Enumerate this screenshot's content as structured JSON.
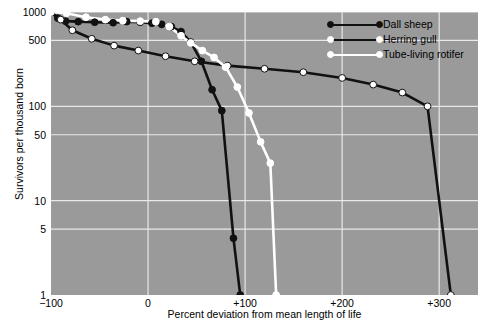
{
  "chart_data": {
    "type": "line",
    "title": "",
    "xlabel": "Percent deviation from mean length of life",
    "ylabel": "Survivors per thousand born",
    "xlim": [
      -100,
      340
    ],
    "ylim": [
      1,
      1000
    ],
    "yscale": "log",
    "grid": true,
    "legend_position": "top-right",
    "background_color": "#9a9a9a",
    "xticks": [
      {
        "value": -100,
        "label": "−100"
      },
      {
        "value": 0,
        "label": "0"
      },
      {
        "value": 100,
        "label": "+100"
      },
      {
        "value": 200,
        "label": "+200"
      },
      {
        "value": 300,
        "label": "+300"
      }
    ],
    "yticks": [
      {
        "value": 1000,
        "label": "1000"
      },
      {
        "value": 500,
        "label": "500"
      },
      {
        "value": 100,
        "label": "100"
      },
      {
        "value": 50,
        "label": "50"
      },
      {
        "value": 10,
        "label": "10"
      },
      {
        "value": 5,
        "label": "5"
      },
      {
        "value": 1,
        "label": "1"
      }
    ],
    "gridlines_x": [
      0,
      100,
      200,
      300
    ],
    "gridlines_y": [
      1000,
      500,
      100,
      50,
      10,
      5
    ],
    "series": [
      {
        "name": "Dall sheep",
        "line_color": "#111111",
        "marker_color": "#111111",
        "marker_edge": "#111111",
        "points": [
          {
            "x": -100,
            "y": 1000
          },
          {
            "x": -93,
            "y": 860
          },
          {
            "x": -85,
            "y": 800
          },
          {
            "x": -72,
            "y": 790
          },
          {
            "x": -55,
            "y": 780
          },
          {
            "x": -36,
            "y": 770
          },
          {
            "x": -22,
            "y": 790
          },
          {
            "x": -8,
            "y": 780
          },
          {
            "x": 4,
            "y": 760
          },
          {
            "x": 14,
            "y": 740
          },
          {
            "x": 24,
            "y": 700
          },
          {
            "x": 34,
            "y": 620
          },
          {
            "x": 44,
            "y": 480
          },
          {
            "x": 55,
            "y": 300
          },
          {
            "x": 66,
            "y": 150
          },
          {
            "x": 76,
            "y": 90
          },
          {
            "x": 88,
            "y": 4
          },
          {
            "x": 95,
            "y": 1
          }
        ]
      },
      {
        "name": "Herring gull",
        "line_color": "#111111",
        "marker_color": "#ffffff",
        "marker_edge": "#111111",
        "points": [
          {
            "x": -100,
            "y": 1000
          },
          {
            "x": -90,
            "y": 830
          },
          {
            "x": -78,
            "y": 640
          },
          {
            "x": -58,
            "y": 520
          },
          {
            "x": -35,
            "y": 440
          },
          {
            "x": -10,
            "y": 390
          },
          {
            "x": 18,
            "y": 340
          },
          {
            "x": 48,
            "y": 300
          },
          {
            "x": 82,
            "y": 270
          },
          {
            "x": 120,
            "y": 250
          },
          {
            "x": 160,
            "y": 230
          },
          {
            "x": 200,
            "y": 200
          },
          {
            "x": 232,
            "y": 170
          },
          {
            "x": 262,
            "y": 140
          },
          {
            "x": 288,
            "y": 100
          },
          {
            "x": 312,
            "y": 1
          }
        ]
      },
      {
        "name": "Tube-living rotifer",
        "line_color": "#ffffff",
        "marker_color": "#ffffff",
        "marker_edge": "#ffffff",
        "points": [
          {
            "x": -100,
            "y": 1000
          },
          {
            "x": -84,
            "y": 970
          },
          {
            "x": -64,
            "y": 880
          },
          {
            "x": -44,
            "y": 830
          },
          {
            "x": -26,
            "y": 810
          },
          {
            "x": -8,
            "y": 800
          },
          {
            "x": 8,
            "y": 790
          },
          {
            "x": 22,
            "y": 700
          },
          {
            "x": 34,
            "y": 560
          },
          {
            "x": 44,
            "y": 470
          },
          {
            "x": 56,
            "y": 390
          },
          {
            "x": 68,
            "y": 330
          },
          {
            "x": 80,
            "y": 260
          },
          {
            "x": 92,
            "y": 160
          },
          {
            "x": 104,
            "y": 85
          },
          {
            "x": 116,
            "y": 42
          },
          {
            "x": 126,
            "y": 25
          },
          {
            "x": 132,
            "y": 1
          }
        ]
      }
    ]
  },
  "legend": {
    "entries": [
      {
        "label": "Dall sheep",
        "line_color": "#111111",
        "dot_color": "#111111"
      },
      {
        "label": "Herring gull",
        "line_color": "#111111",
        "dot_color": "#ffffff"
      },
      {
        "label": "Tube-living rotifer",
        "line_color": "#ffffff",
        "dot_color": "#ffffff"
      }
    ]
  }
}
